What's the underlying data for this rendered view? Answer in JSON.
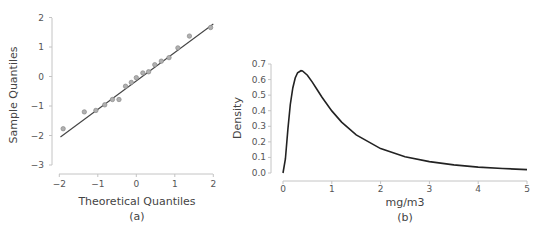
{
  "chart_data": [
    {
      "type": "scatter",
      "panel": "(a)",
      "title": "",
      "xlabel": "Theoretical Quantiles",
      "ylabel": "Sample Quantiles",
      "caption": "(a)",
      "xlim": [
        -2,
        2
      ],
      "ylim": [
        -3,
        2
      ],
      "xticks": [
        -2,
        -1,
        0,
        1,
        2
      ],
      "yticks": [
        -3,
        -2,
        -1,
        0,
        1,
        2
      ],
      "xtick_labels": [
        "−2",
        "−1",
        "0",
        "1",
        "2"
      ],
      "ytick_labels": [
        "−3",
        "−2",
        "−1",
        "0",
        "1",
        "2"
      ],
      "grid": false,
      "points": [
        {
          "x": -1.9,
          "y": -1.77
        },
        {
          "x": -1.35,
          "y": -1.2
        },
        {
          "x": -1.05,
          "y": -1.15
        },
        {
          "x": -0.82,
          "y": -0.96
        },
        {
          "x": -0.62,
          "y": -0.78
        },
        {
          "x": -0.45,
          "y": -0.78
        },
        {
          "x": -0.28,
          "y": -0.33
        },
        {
          "x": -0.13,
          "y": -0.2
        },
        {
          "x": 0.0,
          "y": -0.04
        },
        {
          "x": 0.17,
          "y": 0.12
        },
        {
          "x": 0.32,
          "y": 0.16
        },
        {
          "x": 0.48,
          "y": 0.4
        },
        {
          "x": 0.65,
          "y": 0.52
        },
        {
          "x": 0.85,
          "y": 0.64
        },
        {
          "x": 1.08,
          "y": 0.97
        },
        {
          "x": 1.38,
          "y": 1.37
        },
        {
          "x": 1.93,
          "y": 1.66
        }
      ],
      "reference_line": {
        "x1": -1.97,
        "y1": -2.05,
        "x2": 2.0,
        "y2": 1.78
      },
      "colors": {
        "point_fill": "#b0b0b0",
        "point_stroke": "#8a8a8a",
        "line": "#444444",
        "axis": "#bbbbbb"
      }
    },
    {
      "type": "line",
      "panel": "(b)",
      "title": "",
      "xlabel": "mg/m3",
      "ylabel": "Density",
      "caption": "(b)",
      "xlim": [
        0,
        5
      ],
      "ylim": [
        0,
        0.7
      ],
      "xticks": [
        0,
        1,
        2,
        3,
        4,
        5
      ],
      "yticks": [
        0.0,
        0.1,
        0.2,
        0.3,
        0.4,
        0.5,
        0.6,
        0.7
      ],
      "xtick_labels": [
        "0",
        "1",
        "2",
        "3",
        "4",
        "5"
      ],
      "ytick_labels": [
        "0.0",
        "0.1",
        "0.2",
        "0.3",
        "0.4",
        "0.5",
        "0.6",
        "0.7"
      ],
      "grid": false,
      "series": [
        {
          "name": "lognormal density",
          "x": [
            0,
            0.05,
            0.1,
            0.15,
            0.2,
            0.25,
            0.3,
            0.368,
            0.4,
            0.5,
            0.6,
            0.7,
            0.8,
            1.0,
            1.2,
            1.5,
            2.0,
            2.5,
            3.0,
            3.5,
            4.0,
            4.5,
            5.0
          ],
          "y": [
            0,
            0.09,
            0.282,
            0.44,
            0.546,
            0.61,
            0.644,
            0.657,
            0.655,
            0.628,
            0.584,
            0.535,
            0.486,
            0.399,
            0.327,
            0.245,
            0.157,
            0.105,
            0.073,
            0.052,
            0.038,
            0.029,
            0.022
          ]
        }
      ],
      "colors": {
        "line": "#222222",
        "axis": "#bbbbbb"
      }
    }
  ]
}
